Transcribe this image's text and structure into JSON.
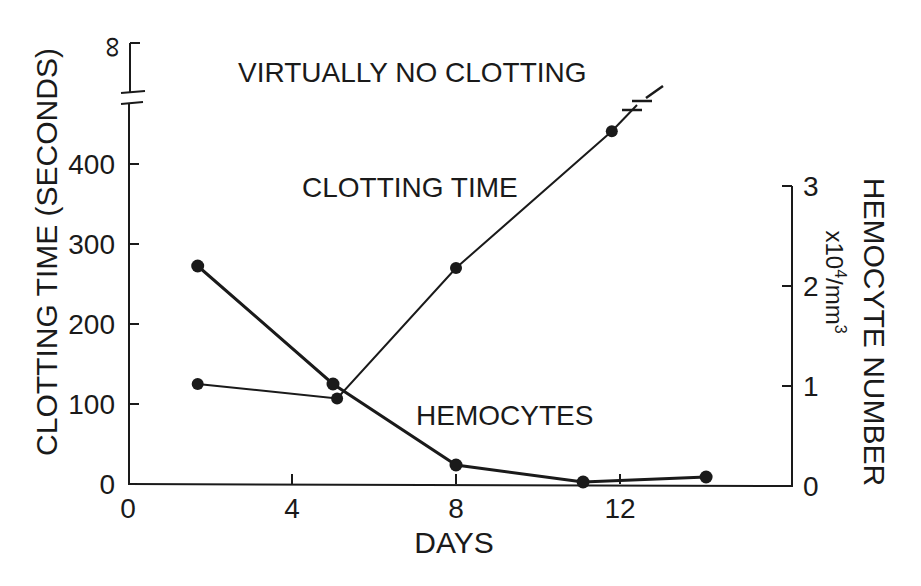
{
  "chart_data": {
    "type": "line",
    "title": "",
    "xlabel": "DAYS",
    "ylabel": "CLOTTING TIME (SECONDS)",
    "y2label": "HEMOCYTE NUMBER",
    "y2label_units": "x10⁴/mm³",
    "xlim": [
      0,
      16
    ],
    "ylim": [
      0,
      450
    ],
    "y2lim": [
      0,
      3
    ],
    "x_ticks": [
      0,
      4,
      8,
      12
    ],
    "y_ticks": [
      0,
      100,
      200,
      300,
      400
    ],
    "y_tick_break_label": "∞",
    "y2_ticks": [
      0,
      1,
      2,
      3
    ],
    "grid": false,
    "legend": "inline labels",
    "annotations": [
      {
        "text": "VIRTUALLY NO CLOTTING",
        "x": 2.7,
        "y_px": 82
      },
      {
        "text": "CLOTTING TIME",
        "x": 4.2,
        "y_px": 197
      },
      {
        "text": "HEMOCYTES",
        "x": 7.0,
        "y_px": 425
      }
    ],
    "series": [
      {
        "name": "CLOTTING TIME",
        "axis": "left",
        "unit": "seconds",
        "x": [
          1.7,
          5.1,
          8.0,
          11.8
        ],
        "values": [
          125,
          107,
          270,
          441
        ],
        "continues_to": "∞ (virtually no clotting, axis break)"
      },
      {
        "name": "HEMOCYTES",
        "axis": "right",
        "unit": "x10⁴/mm³",
        "x": [
          1.7,
          5.0,
          8.0,
          11.1,
          14.1
        ],
        "values": [
          2.2,
          1.02,
          0.21,
          0.04,
          0.09
        ]
      }
    ]
  },
  "labels": {
    "infinity": "∞",
    "x_axis_title": "DAYS",
    "y_axis_title": "CLOTTING TIME (SECONDS)",
    "y2_axis_title": "HEMOCYTE NUMBER",
    "y2_units_prefix": "x10",
    "y2_units_exp": "4",
    "y2_units_mid": "/mm",
    "y2_units_exp2": "3",
    "no_clot": "VIRTUALLY NO CLOTTING",
    "clot_series": "CLOTTING TIME",
    "hemo_series": "HEMOCYTES",
    "x_ticks": [
      "0",
      "4",
      "8",
      "12"
    ],
    "y_ticks": [
      "0",
      "100",
      "200",
      "300",
      "400"
    ],
    "y2_ticks": [
      "0",
      "1",
      "2",
      "3"
    ]
  }
}
